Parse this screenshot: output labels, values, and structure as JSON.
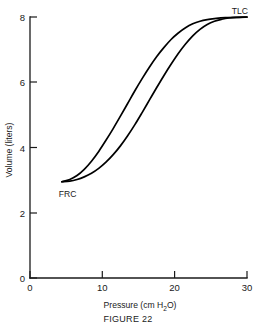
{
  "figure": {
    "caption": "FIGURE 22",
    "background_color": "#ffffff",
    "line_color": "#000000"
  },
  "chart_data": {
    "type": "line",
    "title": "",
    "xlabel": "Pressure  (cm H₂O)",
    "ylabel": "Volume (liters)",
    "xlim": [
      0,
      30
    ],
    "ylim": [
      0,
      8
    ],
    "xticks": [
      0,
      10,
      20,
      30
    ],
    "yticks": [
      0,
      2,
      4,
      6,
      8
    ],
    "xtick_labels": [
      "0",
      "10",
      "20",
      "30"
    ],
    "ytick_labels": [
      "0",
      "2",
      "4",
      "6",
      "8"
    ],
    "grid": false,
    "legend": "none",
    "annotations": [
      {
        "text": "TLC",
        "x": 29,
        "y": 8.2
      },
      {
        "text": "FRC",
        "x": 5.2,
        "y": 2.6
      }
    ],
    "series": [
      {
        "name": "deflation-limb",
        "points": [
          [
            4.4,
            2.95
          ],
          [
            5.5,
            3.02
          ],
          [
            6.5,
            3.14
          ],
          [
            7.5,
            3.33
          ],
          [
            8.5,
            3.58
          ],
          [
            9.5,
            3.88
          ],
          [
            10.5,
            4.22
          ],
          [
            11.5,
            4.58
          ],
          [
            12.5,
            4.96
          ],
          [
            13.5,
            5.35
          ],
          [
            14.5,
            5.74
          ],
          [
            15.5,
            6.11
          ],
          [
            16.5,
            6.46
          ],
          [
            17.5,
            6.78
          ],
          [
            18.5,
            7.06
          ],
          [
            19.5,
            7.31
          ],
          [
            20.5,
            7.51
          ],
          [
            21.5,
            7.67
          ],
          [
            22.5,
            7.79
          ],
          [
            23.5,
            7.87
          ],
          [
            24.5,
            7.92
          ],
          [
            25.5,
            7.95
          ],
          [
            27.0,
            7.98
          ],
          [
            30.0,
            8.0
          ]
        ]
      },
      {
        "name": "inflation-limb",
        "points": [
          [
            4.4,
            2.95
          ],
          [
            5.5,
            2.97
          ],
          [
            6.5,
            3.02
          ],
          [
            7.5,
            3.1
          ],
          [
            8.5,
            3.21
          ],
          [
            9.5,
            3.36
          ],
          [
            10.5,
            3.55
          ],
          [
            11.5,
            3.78
          ],
          [
            12.5,
            4.05
          ],
          [
            13.5,
            4.36
          ],
          [
            14.5,
            4.7
          ],
          [
            15.5,
            5.07
          ],
          [
            16.5,
            5.45
          ],
          [
            17.5,
            5.83
          ],
          [
            18.5,
            6.2
          ],
          [
            19.5,
            6.55
          ],
          [
            20.5,
            6.88
          ],
          [
            21.5,
            7.17
          ],
          [
            22.5,
            7.42
          ],
          [
            23.5,
            7.62
          ],
          [
            24.5,
            7.77
          ],
          [
            25.5,
            7.87
          ],
          [
            26.5,
            7.93
          ],
          [
            27.5,
            7.97
          ],
          [
            28.5,
            7.99
          ],
          [
            30.0,
            8.0
          ]
        ]
      }
    ]
  }
}
